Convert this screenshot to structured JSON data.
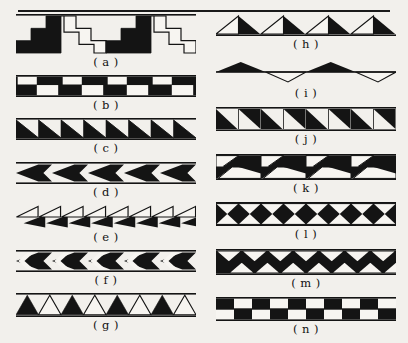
{
  "figure": {
    "background_color": "#f2f0ec",
    "ink_color": "#141414",
    "paper_color": "#f7f5f1",
    "has_top_rule": true
  },
  "columns": [
    {
      "name": "left-column",
      "entries": [
        {
          "key": "a",
          "caption": "( a )",
          "motif": "stepped-meander-alternating-solid-and-outline",
          "band_height": 40,
          "repeats": 2,
          "fill": "alternating",
          "stroke_only_phase": true
        },
        {
          "key": "b",
          "caption": "( b )",
          "motif": "z-step-blocks-solid",
          "band_height": 22,
          "repeats": 4,
          "fill": "solid",
          "stroke_only_phase": false
        },
        {
          "key": "c",
          "caption": "( c )",
          "motif": "right-triangles-sawtooth-solid",
          "band_height": 22,
          "repeats": 8,
          "fill": "solid",
          "stroke_only_phase": false
        },
        {
          "key": "d",
          "caption": "( d )",
          "motif": "left-pointing-chevrons-solid",
          "band_height": 22,
          "repeats": 5,
          "fill": "solid",
          "stroke_only_phase": false
        },
        {
          "key": "e",
          "caption": "( e )",
          "motif": "left-pointing-triangles-outline-over-solid",
          "band_height": 24,
          "repeats": 8,
          "fill": "half",
          "stroke_only_phase": true
        },
        {
          "key": "f",
          "caption": "( f )",
          "motif": "chevrons-with-white-bar-solid",
          "band_height": 22,
          "repeats": 5,
          "fill": "solid",
          "stroke_only_phase": false
        },
        {
          "key": "g",
          "caption": "( g )",
          "motif": "up-triangles-alternating-solid-outline",
          "band_height": 24,
          "repeats": 4,
          "fill": "alternating",
          "stroke_only_phase": true
        }
      ]
    },
    {
      "name": "right-column",
      "entries": [
        {
          "key": "h",
          "caption": "( h )",
          "motif": "triangles-left-outline-right-solid",
          "band_height": 22,
          "repeats": 4,
          "fill": "half",
          "stroke_only_phase": true
        },
        {
          "key": "i",
          "caption": "( i )",
          "motif": "zigzag-line-solid-peaks-outline-valleys",
          "band_height": 26,
          "repeats": 2,
          "fill": "half",
          "stroke_only_phase": true
        },
        {
          "key": "j",
          "caption": "( j )",
          "motif": "paired-right-triangles-in-squares-solid",
          "band_height": 24,
          "repeats": 4,
          "fill": "solid",
          "stroke_only_phase": false
        },
        {
          "key": "k",
          "caption": "( k )",
          "motif": "double-row-zigzag-counterchange",
          "band_height": 26,
          "repeats": 4,
          "fill": "half",
          "stroke_only_phase": true
        },
        {
          "key": "l",
          "caption": "( l )",
          "motif": "bowtie-squares-solid",
          "band_height": 24,
          "repeats": 4,
          "fill": "solid",
          "stroke_only_phase": false
        },
        {
          "key": "m",
          "caption": "( m )",
          "motif": "double-row-opposed-triangles-lattice",
          "band_height": 26,
          "repeats": 7,
          "fill": "solid",
          "stroke_only_phase": false
        },
        {
          "key": "n",
          "caption": "( n )",
          "motif": "checkerboard-two-rows",
          "band_height": 24,
          "repeats": 5,
          "fill": "solid",
          "stroke_only_phase": false
        }
      ]
    }
  ]
}
